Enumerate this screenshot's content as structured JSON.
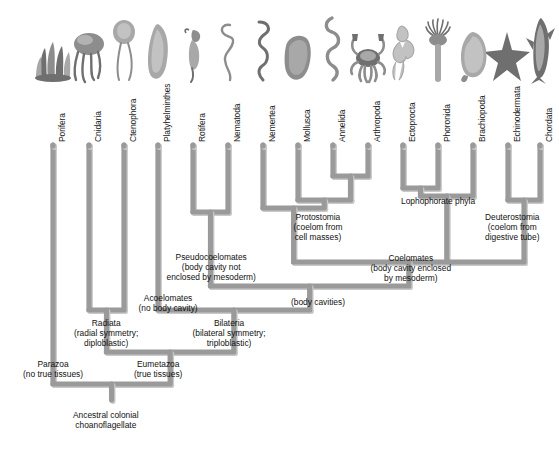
{
  "figure": {
    "type": "phylogenetic-cladogram",
    "root_label": "Ancestral colonial choanoflagellate",
    "branch_color": "#9a9a9a",
    "branch_shadow_color": "#c9c9c9",
    "text_color": "#111111",
    "background": "#ffffff"
  },
  "taxa": [
    {
      "id": "porifera",
      "label": "Porifera",
      "x": 53,
      "organism": "sponge"
    },
    {
      "id": "cnidaria",
      "label": "Cnidaria",
      "x": 89,
      "organism": "jellyfish"
    },
    {
      "id": "ctenophora",
      "label": "Ctenophora",
      "x": 124,
      "organism": "comb-jelly"
    },
    {
      "id": "platyhelminthes",
      "label": "Platyhelminthes",
      "x": 158,
      "organism": "flatworm"
    },
    {
      "id": "rotifera",
      "label": "Rotifera",
      "x": 193,
      "organism": "rotifer"
    },
    {
      "id": "nematoda",
      "label": "Nematoda",
      "x": 228,
      "organism": "roundworm"
    },
    {
      "id": "nemertea",
      "label": "Nemertea",
      "x": 263,
      "organism": "ribbon-worm"
    },
    {
      "id": "mollusca",
      "label": "Mollusca",
      "x": 298,
      "organism": "clam"
    },
    {
      "id": "annelida",
      "label": "Annelida",
      "x": 333,
      "organism": "segmented-worm"
    },
    {
      "id": "arthropoda",
      "label": "Arthropoda",
      "x": 368,
      "organism": "crab"
    },
    {
      "id": "ectoprocta",
      "label": "Ectoprocta",
      "x": 403,
      "organism": "bryozoan"
    },
    {
      "id": "phoronida",
      "label": "Phoronida",
      "x": 438,
      "organism": "phoronid"
    },
    {
      "id": "brachiopoda",
      "label": "Brachiopoda",
      "x": 473,
      "organism": "lamp-shell"
    },
    {
      "id": "echinodermata",
      "label": "Echinodermata",
      "x": 508,
      "organism": "sea-star"
    },
    {
      "id": "chordata",
      "label": "Chordata",
      "x": 540,
      "organism": "shark"
    }
  ],
  "nodes": [
    {
      "id": "protostomia",
      "lines": [
        "Protostomia",
        "(coelom from",
        "cell masses)"
      ],
      "x": 318,
      "y": 212
    },
    {
      "id": "lophophorate",
      "lines": [
        "Lophophorate phyla"
      ],
      "x": 438,
      "y": 196
    },
    {
      "id": "deuterostomia",
      "lines": [
        "Deuterostomia",
        "(coelom from",
        "digestive tube)"
      ],
      "x": 512,
      "y": 212
    },
    {
      "id": "coelomates",
      "lines": [
        "Coelomates",
        "(body cavity enclosed",
        "by mesoderm)"
      ],
      "x": 411,
      "y": 253
    },
    {
      "id": "pseudocoelomates",
      "lines": [
        "Pseudocoelomates",
        "(body cavity not",
        "enclosed by mesoderm)"
      ],
      "x": 211,
      "y": 252
    },
    {
      "id": "body-cavities",
      "lines": [
        "(body cavities)"
      ],
      "x": 318,
      "y": 297
    },
    {
      "id": "acoelomates",
      "lines": [
        "Acoelomates",
        "(no body cavity)"
      ],
      "x": 168,
      "y": 293
    },
    {
      "id": "radiata",
      "lines": [
        "Radiata",
        "(radial symmetry;",
        "diploblastic)"
      ],
      "x": 106,
      "y": 318
    },
    {
      "id": "bilateria",
      "lines": [
        "Bilateria",
        "(bilateral symmetry;",
        "triploblastic)"
      ],
      "x": 229,
      "y": 318
    },
    {
      "id": "parazoa",
      "lines": [
        "Parazoa",
        "(no true tissues)"
      ],
      "x": 53,
      "y": 359
    },
    {
      "id": "eumetazoa",
      "lines": [
        "Eumetazoa",
        "(true tissues)"
      ],
      "x": 158,
      "y": 359
    },
    {
      "id": "ancestor",
      "lines": [
        "Ancestral colonial",
        "choanoflagellate"
      ],
      "x": 106,
      "y": 410
    }
  ],
  "geometry": {
    "label_baseline_y": 142,
    "tip_top_y": 145,
    "stroke_width": 5.2
  }
}
